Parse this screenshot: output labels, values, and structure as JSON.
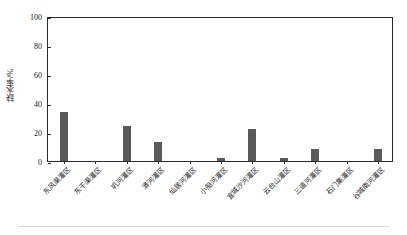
{
  "chart_data": {
    "type": "bar",
    "title": "",
    "subtitle": "",
    "xlabel": "",
    "ylabel": "缺水率/%",
    "ylim": [
      0,
      100
    ],
    "yticks": [
      0,
      20,
      40,
      60,
      80,
      100
    ],
    "ytick_labels": [
      "0",
      "20",
      "40",
      "60",
      "80",
      "100"
    ],
    "grid": false,
    "legend": null,
    "legend_position": "none",
    "bar_color": "#595959",
    "axis_color": "#2b2b2b",
    "categories": [
      "东风渠灌区",
      "东干渠灌区",
      "巩河灌区",
      "漭河灌区",
      "仙居河灌区",
      "小river河灌区",
      "宜城沙河灌区",
      "云台山灌区",
      "三道河灌区",
      "石门集灌区",
      "谷城南河灌区"
    ],
    "values": [
      34,
      0,
      24,
      13,
      0,
      2,
      22,
      2,
      8,
      0,
      8
    ],
    "value_unit": "%",
    "annotations": []
  },
  "axis": {
    "y_title": "缺水率/%",
    "y_tick_labels": [
      "0",
      "20",
      "40",
      "60",
      "80",
      "100"
    ]
  },
  "categories_labels": [
    "东风渠灌区",
    "东干渠灌区",
    "巩河灌区",
    "漭河灌区",
    "仙居河灌区",
    "小船河灌区",
    "宜城沙河灌区",
    "云台山灌区",
    "三道河灌区",
    "石门集灌区",
    "谷城南河灌区"
  ]
}
